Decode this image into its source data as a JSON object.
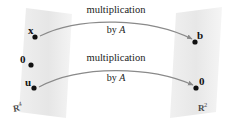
{
  "diagram": {
    "background_color": "#ffffff",
    "plane_fill": "#e9e9e9",
    "arrow_color": "#8a8a8a",
    "dot_color": "#111111",
    "left_plane": {
      "space_label_symbol": "R",
      "space_label_exponent": "4",
      "points": [
        {
          "label": "x",
          "dot_x": 35,
          "dot_y": 37,
          "label_x": 28,
          "label_y": 26
        },
        {
          "label": "0",
          "dot_x": 31,
          "dot_y": 65,
          "label_x": 21,
          "label_y": 55
        },
        {
          "label": "u",
          "dot_x": 34,
          "dot_y": 88,
          "label_x": 26,
          "label_y": 78
        }
      ]
    },
    "right_plane": {
      "space_label_symbol": "R",
      "space_label_exponent": "2",
      "points": [
        {
          "label": "b",
          "dot_x": 195,
          "dot_y": 42,
          "label_x": 197,
          "label_y": 30
        },
        {
          "label": "0",
          "dot_x": 196,
          "dot_y": 88,
          "label_x": 198,
          "label_y": 76
        }
      ]
    },
    "arrows": [
      {
        "name": "upper",
        "line1": "multiplication",
        "line2_prefix": "by ",
        "line2_italic": "A"
      },
      {
        "name": "lower",
        "line1": "multiplication",
        "line2_prefix": "by ",
        "line2_italic": "A"
      }
    ]
  }
}
